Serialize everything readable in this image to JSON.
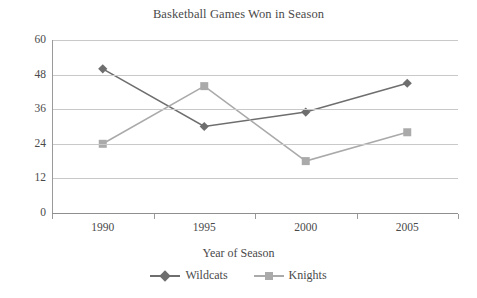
{
  "chart_data": {
    "type": "line",
    "title": "Basketball Games Won in Season",
    "xlabel": "Year of Season",
    "ylabel": "",
    "categories": [
      "1990",
      "1995",
      "2000",
      "2005"
    ],
    "ylim": [
      0,
      60
    ],
    "yticks": [
      0,
      12,
      24,
      36,
      48,
      60
    ],
    "ytick_labels": [
      "0",
      "12",
      "24",
      "36",
      "48",
      "60"
    ],
    "grid": true,
    "legend_position": "bottom",
    "series": [
      {
        "name": "Wildcats",
        "values": [
          50,
          30,
          35,
          45
        ],
        "color": "#6e6e6e",
        "marker": "diamond"
      },
      {
        "name": "Knights",
        "values": [
          24,
          44,
          18,
          28
        ],
        "color": "#aaaaaa",
        "marker": "square"
      }
    ]
  }
}
